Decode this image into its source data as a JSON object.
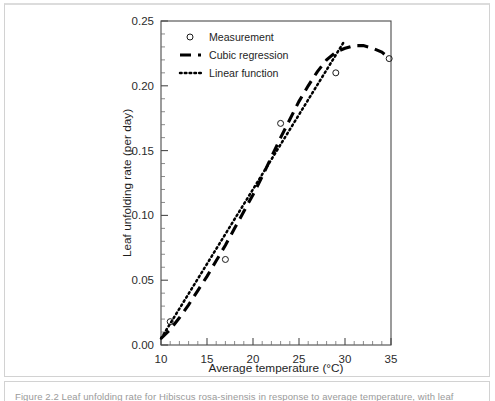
{
  "page": {
    "caption": "Figure 2.2  Leaf unfolding rate for Hibiscus rosa-sinensis in response to average temperature, with leaf"
  },
  "chart_data": {
    "type": "scatter",
    "title": "",
    "xlabel": "Average temperature (°C)",
    "ylabel": "Leaf unfolding rate (per day)",
    "xlim": [
      10,
      35
    ],
    "ylim": [
      0.0,
      0.25
    ],
    "xticks": [
      10,
      15,
      20,
      25,
      30,
      35
    ],
    "xticklabels": [
      "10",
      "15",
      "20",
      "25",
      "30",
      "35"
    ],
    "yticks": [
      0.0,
      0.05,
      0.1,
      0.15,
      0.2,
      0.25
    ],
    "yticklabels": [
      "0.00",
      "0.05",
      "0.10",
      "0.15",
      "0.20",
      "0.25"
    ],
    "x_minor_step": 1,
    "y_minor_step": 0.01,
    "grid": false,
    "legend_position": "upper left inside",
    "series": [
      {
        "name": "Measurement",
        "type": "scatter",
        "marker": "open-circle",
        "points": [
          {
            "x": 11.0,
            "y": 0.018
          },
          {
            "x": 17.0,
            "y": 0.066
          },
          {
            "x": 23.0,
            "y": 0.171
          },
          {
            "x": 29.0,
            "y": 0.21
          },
          {
            "x": 34.8,
            "y": 0.221
          }
        ]
      },
      {
        "name": "Cubic regression",
        "type": "line",
        "style": "dashed",
        "points": [
          {
            "x": 10.0,
            "y": 0.005
          },
          {
            "x": 11.0,
            "y": 0.012
          },
          {
            "x": 12.0,
            "y": 0.021
          },
          {
            "x": 13.0,
            "y": 0.031
          },
          {
            "x": 14.0,
            "y": 0.042
          },
          {
            "x": 15.0,
            "y": 0.053
          },
          {
            "x": 16.0,
            "y": 0.065
          },
          {
            "x": 17.0,
            "y": 0.077
          },
          {
            "x": 18.0,
            "y": 0.09
          },
          {
            "x": 19.0,
            "y": 0.103
          },
          {
            "x": 20.0,
            "y": 0.116
          },
          {
            "x": 21.0,
            "y": 0.13
          },
          {
            "x": 22.0,
            "y": 0.145
          },
          {
            "x": 23.0,
            "y": 0.16
          },
          {
            "x": 24.0,
            "y": 0.174
          },
          {
            "x": 25.0,
            "y": 0.188
          },
          {
            "x": 26.0,
            "y": 0.2
          },
          {
            "x": 27.0,
            "y": 0.211
          },
          {
            "x": 28.0,
            "y": 0.22
          },
          {
            "x": 29.0,
            "y": 0.226
          },
          {
            "x": 30.0,
            "y": 0.229
          },
          {
            "x": 31.0,
            "y": 0.231
          },
          {
            "x": 32.0,
            "y": 0.231
          },
          {
            "x": 33.0,
            "y": 0.229
          },
          {
            "x": 34.0,
            "y": 0.226
          },
          {
            "x": 34.9,
            "y": 0.221
          }
        ]
      },
      {
        "name": "Linear function",
        "type": "line",
        "style": "dotted",
        "points": [
          {
            "x": 10.0,
            "y": 0.005
          },
          {
            "x": 29.8,
            "y": 0.233
          }
        ]
      }
    ],
    "legend": [
      {
        "label": "Measurement",
        "marker": "open-circle"
      },
      {
        "label": "Cubic regression",
        "marker": "dashed-line"
      },
      {
        "label": "Linear function",
        "marker": "dotted-line"
      }
    ]
  }
}
